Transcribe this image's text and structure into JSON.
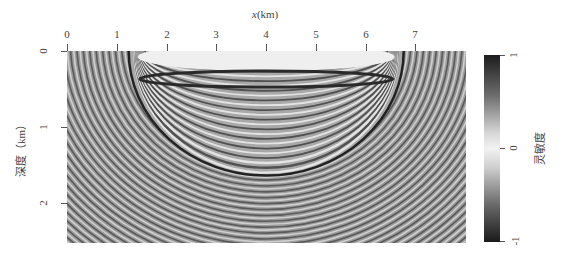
{
  "chart_data": {
    "type": "heatmap",
    "title": "",
    "xlabel": "x(km)",
    "ylabel": "深度（km）",
    "xlim": [
      0,
      8
    ],
    "ylim": [
      2.5,
      0
    ],
    "x_ticks": [
      "0",
      "1",
      "2",
      "3",
      "4",
      "5",
      "6",
      "7"
    ],
    "y_ticks": [
      "0",
      "1",
      "2"
    ],
    "x_axis_position": "top",
    "colorbar": {
      "label": "灵敏度",
      "ticks": [
        "1",
        "0",
        "-1"
      ],
      "range": [
        -1,
        1
      ],
      "colormap": "grayscale (black at ±1, white at 0)"
    },
    "features": {
      "source_x_km": 1.5,
      "receiver_x_km": 6.5,
      "main_ellipse_max_depth_km": 1.6,
      "fringe_region_x_km": [
        0,
        8
      ],
      "fringe_region_depth_km": [
        0,
        2.5
      ]
    },
    "grid": false,
    "legend": "colorbar right"
  },
  "axes": {
    "xlabel_italic": "x",
    "xlabel_unit": "(km)",
    "ylabel": "深度（km）",
    "x_ticks": [
      {
        "label": "0",
        "px": 67
      },
      {
        "label": "1",
        "px": 117
      },
      {
        "label": "2",
        "px": 167
      },
      {
        "label": "3",
        "px": 216
      },
      {
        "label": "4",
        "px": 266
      },
      {
        "label": "5",
        "px": 316
      },
      {
        "label": "6",
        "px": 366
      },
      {
        "label": "7",
        "px": 415
      }
    ],
    "y_ticks": [
      {
        "label": "0",
        "px": 51
      },
      {
        "label": "1",
        "px": 127
      },
      {
        "label": "2",
        "px": 203
      }
    ]
  },
  "colorbar": {
    "label": "灵敏度",
    "ticks": [
      {
        "label": "1",
        "px": 55
      },
      {
        "label": "0",
        "px": 148
      },
      {
        "label": "-1",
        "px": 241
      }
    ]
  }
}
